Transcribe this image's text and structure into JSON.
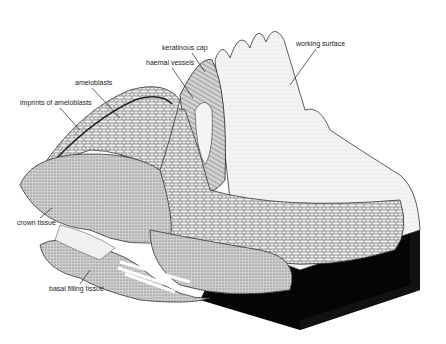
{
  "figure": {
    "labels": [
      {
        "id": "keratinous-cap",
        "text": "keratinous cap",
        "x": 162,
        "y": 44,
        "lx1": 192,
        "ly1": 53,
        "lx2": 205,
        "ly2": 72
      },
      {
        "id": "haemal-vessels",
        "text": "haemal vessels",
        "x": 146,
        "y": 59,
        "lx1": 172,
        "ly1": 68,
        "lx2": 193,
        "ly2": 98
      },
      {
        "id": "ameloblasts",
        "text": "ameloblasts",
        "x": 75,
        "y": 79,
        "lx1": 92,
        "ly1": 88,
        "lx2": 120,
        "ly2": 118
      },
      {
        "id": "imprints-of-ameloblasts",
        "text": "imprints of ameloblasts",
        "x": 20,
        "y": 99,
        "lx1": 60,
        "ly1": 108,
        "lx2": 80,
        "ly2": 130
      },
      {
        "id": "working-surface",
        "text": "working surface",
        "x": 296,
        "y": 40,
        "lx1": 316,
        "ly1": 49,
        "lx2": 290,
        "ly2": 85
      },
      {
        "id": "crown-tissue",
        "text": "crown tissue",
        "x": 17,
        "y": 219,
        "lx1": 40,
        "ly1": 218,
        "lx2": 52,
        "ly2": 208
      },
      {
        "id": "basal-filling-tissue",
        "text": "basal filling tissue",
        "x": 49,
        "y": 285,
        "lx1": 80,
        "ly1": 284,
        "lx2": 90,
        "ly2": 270
      }
    ],
    "colors": {
      "ink": "#1a1a1a",
      "fill_light": "#e8e8e8",
      "fill_mid": "#b5b5b5",
      "fill_dark": "#7a7a7a",
      "block": "#050505",
      "paper": "#ffffff"
    }
  }
}
